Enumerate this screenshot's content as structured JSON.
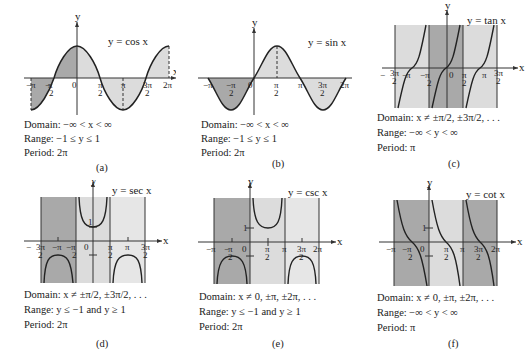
{
  "figure": {
    "panels": [
      {
        "id": "a",
        "function_label": "y = cos x",
        "caption": "(a)",
        "domain": "Domain: −∞ < x < ∞",
        "range": "Range: −1 ≤ y ≤ 1",
        "period": "Period: 2π",
        "x_ticks": [
          "−π",
          "−π/2",
          "0",
          "π/2",
          "π",
          "3π/2",
          "2π"
        ],
        "axis_x": "x",
        "axis_y": "y"
      },
      {
        "id": "b",
        "function_label": "y = sin x",
        "caption": "(b)",
        "domain": "Domain: −∞ < x < ∞",
        "range": "Range: −1 ≤ y ≤ 1",
        "period": "Period: 2π",
        "x_ticks": [
          "−π",
          "−π/2",
          "0",
          "π/2",
          "π",
          "3π/2",
          "2π"
        ],
        "axis_x": "x",
        "axis_y": "y"
      },
      {
        "id": "c",
        "function_label": "y = tan x",
        "caption": "(c)",
        "domain": "Domain: x ≠ ±π/2, ±3π/2, . . .",
        "range": "Range: −∞ < y < ∞",
        "period": "Period: π",
        "x_ticks": [
          "−3π/2",
          "−π",
          "−π/2",
          "0",
          "π/2",
          "π",
          "3π/2"
        ],
        "axis_x": "x",
        "axis_y": "y"
      },
      {
        "id": "d",
        "function_label": "y = sec x",
        "caption": "(d)",
        "domain": "Domain: x ≠ ±π/2, ±3π/2, . . .",
        "range": "Range: y ≤ −1 and y ≥ 1",
        "period": "Period: 2π",
        "x_ticks": [
          "−3π/2",
          "−π",
          "−π/2",
          "0",
          "π/2",
          "π",
          "3π/2"
        ],
        "y_ticks": [
          "1"
        ],
        "axis_x": "x",
        "axis_y": "y"
      },
      {
        "id": "e",
        "function_label": "y = csc x",
        "caption": "(e)",
        "domain": "Domain: x ≠ 0, ±π, ±2π, . . .",
        "range": "Range: y ≤ −1 and y ≥ 1",
        "period": "Period: 2π",
        "x_ticks": [
          "−π",
          "−π/2",
          "0",
          "π/2",
          "π",
          "3π/2",
          "2π"
        ],
        "y_ticks": [
          "1"
        ],
        "axis_x": "x",
        "axis_y": "y"
      },
      {
        "id": "f",
        "function_label": "y = cot x",
        "caption": "(f)",
        "domain": "Domain: x ≠ 0, ±π, ±2π, . . .",
        "range": "Range: −∞ < y < ∞",
        "period": "Period: π",
        "x_ticks": [
          "−π",
          "−π/2",
          "0",
          "π/2",
          "π",
          "3π/2",
          "2π"
        ],
        "y_ticks": [
          "1"
        ],
        "axis_x": "x",
        "axis_y": "y"
      }
    ],
    "colors": {
      "dark_shade": "#a9a9a9",
      "light_shade": "#dcdcdc",
      "curve": "#222222",
      "axis": "#333333"
    }
  }
}
